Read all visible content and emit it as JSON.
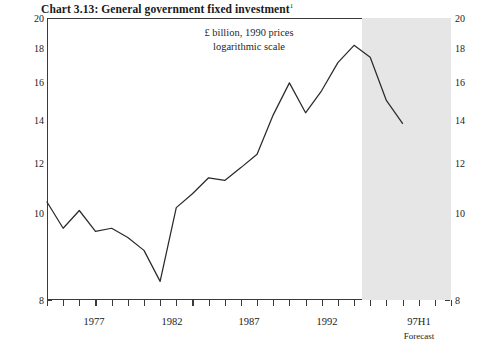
{
  "title": {
    "text": "Chart 3.13: General government fixed investment",
    "footnote_marker": "1"
  },
  "subtitle": {
    "line1": "£ billion, 1990 prices",
    "line2": "logarithmic scale"
  },
  "axes": {
    "y_left_ticks": [
      "20",
      "18",
      "16",
      "14",
      "12",
      "10",
      "8"
    ],
    "y_right_ticks": [
      "20",
      "18",
      "16",
      "14",
      "12",
      "10",
      "8"
    ],
    "x_labels": [
      "1977",
      "1982",
      "1987",
      "1992",
      "97H1"
    ],
    "forecast_label": "Forecast"
  },
  "colors": {
    "line": "#2b2b2b",
    "frame": "#3a3a3a",
    "forecast_shading": "#e6e6e6",
    "background": "#ffffff",
    "text": "#1a1a1a"
  },
  "chart_data": {
    "type": "line",
    "title": "Chart 3.13: General government fixed investment",
    "subtitle": "£ billion, 1990 prices; logarithmic scale",
    "xlabel": "",
    "ylabel": "£ billion, 1990 prices",
    "yscale": "log",
    "ylim": [
      8,
      20
    ],
    "yticks": [
      8,
      10,
      12,
      14,
      16,
      18,
      20
    ],
    "grid": false,
    "legend": null,
    "x_tick_count": 26,
    "x_labelled_ticks": [
      {
        "index": 2,
        "label": "1977"
      },
      {
        "index": 7,
        "label": "1982"
      },
      {
        "index": 12,
        "label": "1987"
      },
      {
        "index": 17,
        "label": "1992"
      },
      {
        "index": 22,
        "label": "97H1"
      }
    ],
    "forecast_start_index": 19.5,
    "forecast_note": "Forecast",
    "x": [
      1975,
      1976,
      1977,
      1978,
      1979,
      1980,
      1981,
      1982,
      1983,
      1984,
      1985,
      1986,
      1987,
      1988,
      1989,
      1990,
      1991,
      1992,
      1993,
      1994,
      1995,
      1996,
      1997
    ],
    "x_display": [
      "1975",
      "1976",
      "1977",
      "1978",
      "1979",
      "1980",
      "1981",
      "1982",
      "1983",
      "1984",
      "1985",
      "1986",
      "1987",
      "1988",
      "1989",
      "1990",
      "1991",
      "1992",
      "1993",
      "1994",
      "1995",
      "1996",
      "97H1"
    ],
    "series": [
      {
        "name": "General government fixed investment",
        "values": [
          11.0,
          10.1,
          10.7,
          10.0,
          10.1,
          9.8,
          9.4,
          8.5,
          10.8,
          11.3,
          11.9,
          11.8,
          12.3,
          12.85,
          14.6,
          16.2,
          14.7,
          15.8,
          17.3,
          18.3,
          17.6,
          15.3,
          14.2
        ]
      }
    ]
  }
}
